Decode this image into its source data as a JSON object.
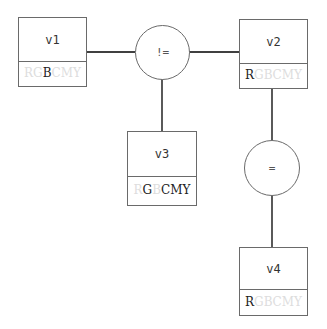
{
  "diagram": {
    "type": "constraint-graph",
    "variables": [
      {
        "id": "v1",
        "label": "v1",
        "domain": [
          {
            "letter": "R",
            "active": false
          },
          {
            "letter": "G",
            "active": false
          },
          {
            "letter": "B",
            "active": true
          },
          {
            "letter": "C",
            "active": false
          },
          {
            "letter": "M",
            "active": false
          },
          {
            "letter": "Y",
            "active": false
          }
        ]
      },
      {
        "id": "v2",
        "label": "v2",
        "domain": [
          {
            "letter": "R",
            "active": true
          },
          {
            "letter": "G",
            "active": false
          },
          {
            "letter": "B",
            "active": false
          },
          {
            "letter": "C",
            "active": false
          },
          {
            "letter": "M",
            "active": false
          },
          {
            "letter": "Y",
            "active": false
          }
        ]
      },
      {
        "id": "v3",
        "label": "v3",
        "domain": [
          {
            "letter": "R",
            "active": false
          },
          {
            "letter": "G",
            "active": true
          },
          {
            "letter": "B",
            "active": false
          },
          {
            "letter": "C",
            "active": true
          },
          {
            "letter": "M",
            "active": true
          },
          {
            "letter": "Y",
            "active": true
          }
        ]
      },
      {
        "id": "v4",
        "label": "v4",
        "domain": [
          {
            "letter": "R",
            "active": true
          },
          {
            "letter": "G",
            "active": false
          },
          {
            "letter": "B",
            "active": false
          },
          {
            "letter": "C",
            "active": false
          },
          {
            "letter": "M",
            "active": false
          },
          {
            "letter": "Y",
            "active": false
          }
        ]
      }
    ],
    "constraints": [
      {
        "id": "c1",
        "label": "!=",
        "connects": [
          "v1",
          "v2",
          "v3"
        ]
      },
      {
        "id": "c2",
        "label": "=",
        "connects": [
          "v2",
          "v4"
        ]
      }
    ],
    "colors": {
      "line": "#000000",
      "border": "#6a6a6a",
      "active_letter": "#222222",
      "inactive_letter": "#dddddd"
    }
  }
}
